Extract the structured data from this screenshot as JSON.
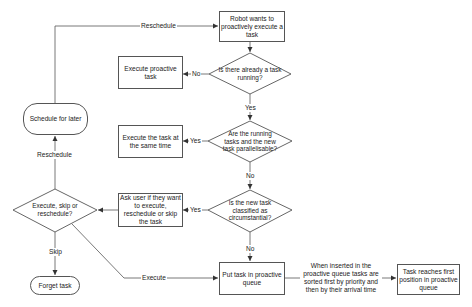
{
  "diagram": {
    "type": "flowchart",
    "colors": {
      "stroke": "#555555",
      "fill": "#ffffff",
      "text": "#222222"
    },
    "nodes": {
      "start": {
        "shape": "rectangle",
        "text": "Robot wants to proactively execute a task"
      },
      "q_running": {
        "shape": "diamond",
        "text": "Is there already a task running?"
      },
      "exec_proactive": {
        "shape": "rectangle",
        "text": "Execute proactive task"
      },
      "q_parallel": {
        "shape": "diamond",
        "text": "Are the running tasks and the new task parallelisable?"
      },
      "exec_same_time": {
        "shape": "rectangle",
        "text": "Execute the task at the same time"
      },
      "q_circumstantial": {
        "shape": "diamond",
        "text": "Is the new task classified as circumstantial?"
      },
      "ask_user": {
        "shape": "rectangle",
        "text": "Ask user if they want to execute, reschedule or skip the task"
      },
      "q_choice": {
        "shape": "diamond",
        "text": "Execute, skip or reschedule?"
      },
      "schedule_later": {
        "shape": "rounded",
        "text": "Schedule for later"
      },
      "forget": {
        "shape": "rounded",
        "text": "Forget task"
      },
      "put_queue": {
        "shape": "rectangle",
        "text": "Put task in proactive queue"
      },
      "first_position": {
        "shape": "rectangle",
        "text": "Task reaches first position in proactive queue"
      }
    },
    "edge_labels": {
      "reschedule_top": "Reschedule",
      "running_no": "No",
      "running_yes": "Yes",
      "parallel_yes": "Yes",
      "parallel_no": "No",
      "circ_yes": "Yes",
      "circ_no": "No",
      "choice_reschedule": "Reschedule",
      "choice_skip": "Skip",
      "choice_execute": "Execute"
    },
    "note": "When inserted in the proactive queue tasks are sorted first by priority and then by their arrival time",
    "edges": [
      {
        "from": "start",
        "to": "q_running"
      },
      {
        "from": "q_running",
        "to": "exec_proactive",
        "label": "No"
      },
      {
        "from": "q_running",
        "to": "q_parallel",
        "label": "Yes"
      },
      {
        "from": "q_parallel",
        "to": "exec_same_time",
        "label": "Yes"
      },
      {
        "from": "q_parallel",
        "to": "q_circumstantial",
        "label": "No"
      },
      {
        "from": "q_circumstantial",
        "to": "ask_user",
        "label": "Yes"
      },
      {
        "from": "q_circumstantial",
        "to": "put_queue",
        "label": "No"
      },
      {
        "from": "ask_user",
        "to": "q_choice"
      },
      {
        "from": "q_choice",
        "to": "schedule_later",
        "label": "Reschedule"
      },
      {
        "from": "q_choice",
        "to": "forget",
        "label": "Skip"
      },
      {
        "from": "q_choice",
        "to": "put_queue",
        "label": "Execute"
      },
      {
        "from": "schedule_later",
        "to": "start",
        "label": "Reschedule"
      },
      {
        "from": "put_queue",
        "to": "first_position"
      }
    ]
  }
}
